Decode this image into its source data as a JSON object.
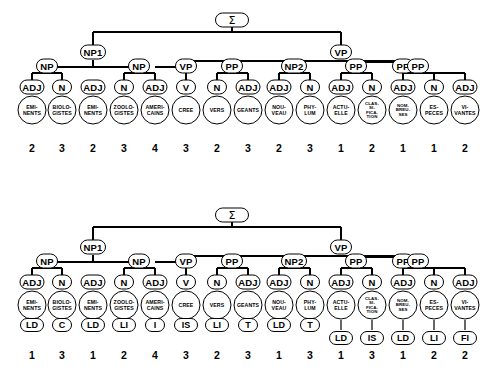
{
  "figure": {
    "sigma_label": "Σ",
    "columns": 15
  },
  "words": [
    "EMI-\nNENTS",
    "BIOLO-\nGISTES",
    "EMI-\nNENTS",
    "ZOOLO-\nGISTES",
    "AMERI-\nCAINS",
    "CREE",
    "VERS",
    "GEANTS",
    "NOU-\nVEAU",
    "PHY-\nLUM",
    "ACTU-\nELLE",
    "CLAS-\nSI-\nFICA-\nTION",
    "NOM-\nBREU-\nSES",
    "ES-\nPECES",
    "VI-\nVANTES"
  ],
  "pos_tags": [
    "ADJ",
    "N",
    "ADJ",
    "N",
    "ADJ",
    "V",
    "N",
    "ADJ",
    "ADJ",
    "N",
    "ADJ",
    "N",
    "ADJ",
    "N",
    "ADJ"
  ],
  "tree_top": {
    "name": "upper-tree",
    "root": "Σ",
    "level1": [
      {
        "label": "NP1",
        "x": 93
      },
      {
        "label": "VP",
        "x": 341
      }
    ],
    "level2": [
      {
        "label": "NP",
        "x": 47
      },
      {
        "label": "NP",
        "x": 139
      },
      {
        "label": "VP",
        "x": 186
      },
      {
        "label": "PP",
        "x": 232
      },
      {
        "label": "NP2",
        "x": 294
      },
      {
        "label": "PP",
        "x": 403
      }
    ],
    "level3": [
      {
        "label": "PP",
        "x": 356
      },
      {
        "label": "PP",
        "x": 418
      }
    ],
    "numbers": [
      2,
      3,
      2,
      3,
      4,
      3,
      2,
      3,
      2,
      3,
      1,
      2,
      1,
      1,
      2
    ]
  },
  "tree_bottom": {
    "name": "lower-tree",
    "root": "Σ",
    "level1": [
      {
        "label": "NP1",
        "x": 93
      },
      {
        "label": "VP",
        "x": 341
      }
    ],
    "level2": [
      {
        "label": "NP",
        "x": 47
      },
      {
        "label": "NP",
        "x": 139
      },
      {
        "label": "VP",
        "x": 186
      },
      {
        "label": "PP",
        "x": 232
      },
      {
        "label": "NP2",
        "x": 294
      },
      {
        "label": "PP",
        "x": 403
      }
    ],
    "level3": [
      {
        "label": "PP",
        "x": 356
      },
      {
        "label": "PP",
        "x": 418
      }
    ],
    "codes": [
      "LD",
      "C",
      "LD",
      "LI",
      "I",
      "IS",
      "LI",
      "T",
      "LD",
      "T",
      "LD",
      "IS",
      "LD",
      "LI",
      "FI"
    ],
    "numbers": [
      1,
      3,
      1,
      2,
      4,
      3,
      2,
      3,
      1,
      3,
      1,
      3,
      1,
      2,
      2
    ]
  },
  "colors": {
    "ink": "#000000",
    "paper": "#ffffff"
  }
}
